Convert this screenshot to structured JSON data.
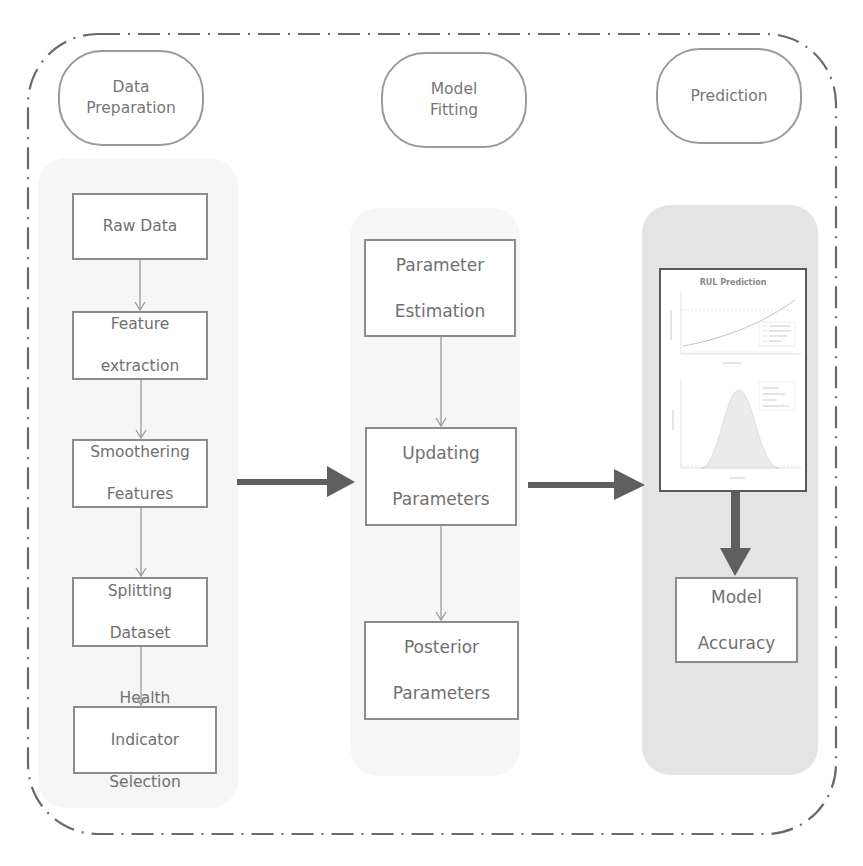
{
  "phases": [
    {
      "id": "data-preparation",
      "label": "Data\nPreparation",
      "line1": "Data",
      "line2": "Preparation"
    },
    {
      "id": "model-fitting",
      "label": "Model\nFitting",
      "line1": "Model",
      "line2": "Fitting"
    },
    {
      "id": "prediction",
      "label": "Prediction",
      "line1": "Prediction",
      "line2": ""
    }
  ],
  "columns": {
    "data_preparation": {
      "steps": [
        {
          "line1": "Raw Data",
          "line2": ""
        },
        {
          "line1": "Feature",
          "line2": "extraction"
        },
        {
          "line1": "Smoothering",
          "line2": "Features"
        },
        {
          "line1": "Splitting",
          "line2": "Dataset"
        },
        {
          "line1": "Health",
          "line2": "Indicator",
          "line3": "Selection"
        }
      ]
    },
    "model_fitting": {
      "steps": [
        {
          "line1": "Parameter",
          "line2": "Estimation"
        },
        {
          "line1": "Updating",
          "line2": "Parameters"
        },
        {
          "line1": "Posterior",
          "line2": "Parameters"
        }
      ]
    },
    "prediction": {
      "thumbnail": {
        "title": "RUL Prediction",
        "top_plot": {
          "xlabel": "Time (cycles)",
          "ylabel": "Health Indicator",
          "legend": [
            "Degradation path",
            "Failure threshold",
            "RUL estimate",
            "Samples"
          ]
        },
        "bottom_plot": {
          "xlabel": "Time (cycles)",
          "ylabel": "Density",
          "legend": [
            "Mean RUL",
            "Predicted RUL",
            "True RUL",
            "Confidence 95%"
          ]
        }
      },
      "steps": [
        {
          "line1": "Model",
          "line2": "Accuracy"
        }
      ]
    }
  },
  "colors": {
    "frame": "#6a6a6a",
    "box_border": "#8c8c8c",
    "text": "#707070",
    "thick_arrow": "#5f5f5f",
    "thin_arrow": "#9a9a9a",
    "prediction_panel": "#e4e4e4",
    "faint_panel": "#f6f6f6"
  }
}
